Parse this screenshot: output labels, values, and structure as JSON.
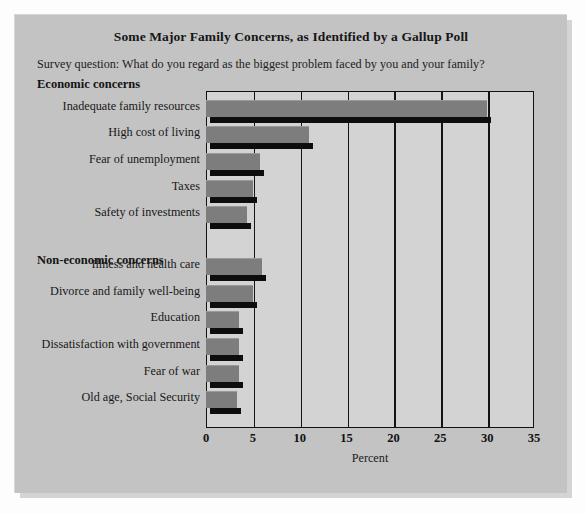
{
  "figure": {
    "title": "Some Major Family Concerns, as Identified by a Gallup Poll",
    "subtitle": "Survey question: What do you regard as the biggest problem faced by you and your family?",
    "panel_color": "#c3c3c3",
    "plot_background": "#d3d3d3",
    "bar_color": "#7d7d7d",
    "axis_color": "#111111"
  },
  "groups": [
    {
      "heading": "Economic concerns"
    },
    {
      "heading": "Non-economic concerns"
    }
  ],
  "chart_data": {
    "type": "bar",
    "orientation": "horizontal",
    "title": "Some Major Family Concerns, as Identified by a Gallup Poll",
    "subtitle": "Survey question: What do you regard as the biggest problem faced by you and your family?",
    "xlabel": "Percent",
    "ylabel": "",
    "xlim": [
      0,
      35
    ],
    "xticks": [
      0,
      5,
      10,
      15,
      20,
      25,
      30,
      35
    ],
    "xtick_labels": [
      "0",
      "5",
      "10",
      "15",
      "20",
      "25",
      "30",
      "35"
    ],
    "grid": true,
    "legend": "none",
    "categories": [
      "Inadequate family resources",
      "High cost of living",
      "Fear of unemployment",
      "Taxes",
      "Safety of investments",
      "Illness and health care",
      "Divorce and family well-being",
      "Education",
      "Dissatisfaction with government",
      "Fear of war",
      "Old age, Social Security"
    ],
    "values": [
      30,
      11,
      5.8,
      5,
      4.4,
      6,
      5,
      3.5,
      3.5,
      3.5,
      3.3
    ],
    "group_of_category": [
      "Economic concerns",
      "Economic concerns",
      "Economic concerns",
      "Economic concerns",
      "Economic concerns",
      "Non-economic concerns",
      "Non-economic concerns",
      "Non-economic concerns",
      "Non-economic concerns",
      "Non-economic concerns",
      "Non-economic concerns"
    ]
  }
}
